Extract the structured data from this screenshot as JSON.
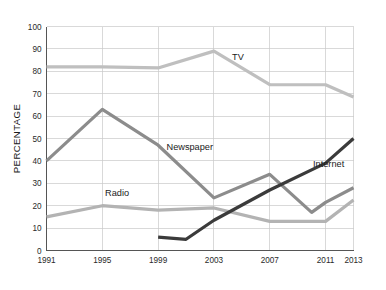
{
  "chart_data": {
    "type": "line",
    "title": "",
    "xlabel": "",
    "ylabel": "PERCENTAGE",
    "xlim": [
      1991,
      2013
    ],
    "ylim": [
      0,
      100
    ],
    "grid": true,
    "legend_position": "inline-labels",
    "x_ticks": [
      "1991",
      "1995",
      "1999",
      "2003",
      "2007",
      "2011",
      "2013"
    ],
    "x_tick_values": [
      1991,
      1995,
      1999,
      2003,
      2007,
      2011,
      2013
    ],
    "y_ticks": [
      "0",
      "10",
      "20",
      "30",
      "40",
      "50",
      "60",
      "70",
      "80",
      "90",
      "100"
    ],
    "y_tick_values": [
      0,
      10,
      20,
      30,
      40,
      50,
      60,
      70,
      80,
      90,
      100
    ],
    "series": [
      {
        "name": "TV",
        "color": "#bfbfbf",
        "width": 3.2,
        "label_x": 2004.3,
        "label_y": 85.0,
        "x": [
          1991,
          1995,
          1999,
          2003,
          2007,
          2011,
          2013
        ],
        "values": [
          82,
          82,
          81.5,
          89,
          74,
          74,
          68.5
        ]
      },
      {
        "name": "Newspaper",
        "color": "#8c8c8c",
        "width": 3.2,
        "label_x": 1999.6,
        "label_y": 45.0,
        "x": [
          1991,
          1995,
          1999,
          2003,
          2007,
          2010,
          2011,
          2013
        ],
        "values": [
          40,
          63,
          47,
          23.5,
          34,
          17,
          21.5,
          28
        ]
      },
      {
        "name": "Radio",
        "color": "#b3b3b3",
        "width": 3.2,
        "label_x": 1995.2,
        "label_y": 24.5,
        "x": [
          1991,
          1995,
          1999,
          2003,
          2007,
          2011,
          2013
        ],
        "values": [
          15,
          20,
          18,
          19,
          13,
          13,
          22.5
        ]
      },
      {
        "name": "Internet",
        "color": "#3b3b3b",
        "width": 3.2,
        "label_x": 2010.1,
        "label_y": 37.5,
        "x": [
          1999,
          2001,
          2003,
          2007,
          2011,
          2013
        ],
        "values": [
          6,
          5,
          13.5,
          27,
          39,
          50
        ]
      }
    ]
  }
}
